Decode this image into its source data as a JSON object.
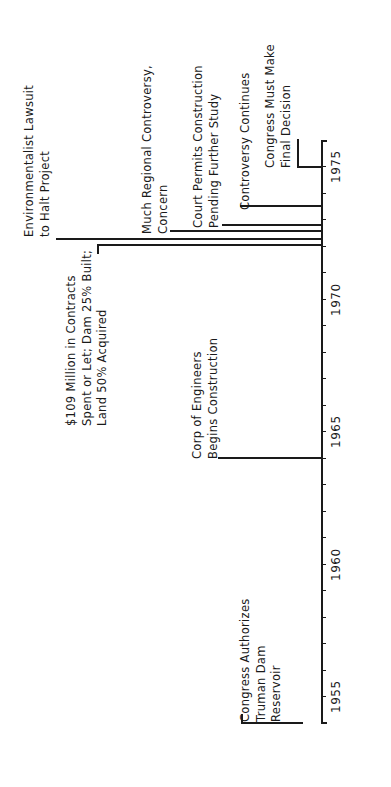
{
  "diagram": {
    "type": "timeline",
    "orientation": "rotated-90-ccw",
    "axis": {
      "start_year": 1954,
      "end_year": 1976,
      "year_labels": [
        "1955",
        "1960",
        "1965",
        "1970",
        "1975"
      ]
    },
    "events": [
      {
        "id": "congress-authorizes",
        "year": 1954,
        "lines": [
          "Congress Authorizes",
          "Truman Dam",
          "Reservoir"
        ]
      },
      {
        "id": "corp-begins",
        "year": 1964,
        "lines": [
          "Corp of Engineers",
          "Begins Construction"
        ]
      },
      {
        "id": "million-contracts",
        "year": 1972.2,
        "lines": [
          "$109 Million in Contracts",
          "Spent or Let; Dam 25% Built;",
          "Land 50% Acquired"
        ]
      },
      {
        "id": "env-lawsuit",
        "year": 1972.4,
        "lines": [
          "Environmentalist Lawsuit",
          "to Halt Project"
        ]
      },
      {
        "id": "regional-controversy",
        "year": 1972.7,
        "lines": [
          "Much Regional Controversy,",
          "Concern"
        ]
      },
      {
        "id": "court-permits",
        "year": 1972.9,
        "lines": [
          "Court Permits Construction",
          "Pending Further Study"
        ]
      },
      {
        "id": "controversy-continues",
        "year": 1973.7,
        "lines": [
          "Controversy Continues"
        ]
      },
      {
        "id": "congress-decision",
        "year": 1975.2,
        "lines": [
          "Congress Must Make",
          "Final Decision"
        ]
      }
    ]
  }
}
